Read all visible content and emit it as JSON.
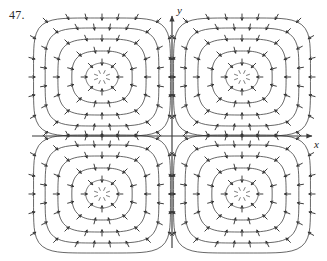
{
  "figure": {
    "exercise_number": "47.",
    "caption": "",
    "background_color": "#ffffff",
    "stroke_color": "#333333",
    "axis_color": "#3a3a3a"
  },
  "axes": {
    "x_label": "x",
    "y_label": "y",
    "origin_px": [
      172,
      136
    ],
    "x_axis_y_px": 136,
    "y_axis_x_px": 172,
    "x_axis_start_px": 32,
    "x_axis_end_px": 312,
    "y_axis_start_px": 248,
    "y_axis_end_px": 16,
    "x_arrowhead": true,
    "y_arrowhead": true,
    "ticks_shown": false,
    "tick_labels": []
  },
  "chart_data": {
    "type": "scatter",
    "title": "",
    "subtitle": "",
    "xlabel": "x",
    "ylabel": "y",
    "xlim": [
      -2.2,
      2.2
    ],
    "ylim": [
      -2.0,
      2.0
    ],
    "grid": false,
    "legend_position": "none",
    "plot_kind": "direction-field-with-contours",
    "annotations": [
      "47."
    ],
    "critical_points": [
      {
        "name": "sink-quadrant-2",
        "x": -1.1,
        "y": 1.0,
        "type": "sink",
        "px": [
          102,
          77
        ]
      },
      {
        "name": "sink-quadrant-1",
        "x": 1.1,
        "y": 1.0,
        "type": "sink",
        "px": [
          242,
          77
        ]
      },
      {
        "name": "sink-quadrant-3",
        "x": -1.1,
        "y": -1.0,
        "type": "sink",
        "px": [
          102,
          194
        ]
      },
      {
        "name": "sink-quadrant-4",
        "x": 1.1,
        "y": -1.0,
        "type": "sink",
        "px": [
          242,
          194
        ]
      }
    ],
    "contour_levels": [
      0.2,
      0.42,
      0.64,
      0.86,
      1.08
    ],
    "contour_radii_px": [
      14,
      26,
      38,
      49,
      59
    ],
    "arrow_rings_px": [
      18,
      30,
      42,
      53,
      63
    ],
    "arrow_direction": "inward",
    "arrows_per_ring": [
      8,
      12,
      16,
      20,
      24
    ],
    "field_bounds_px": {
      "left": 32,
      "right": 312,
      "top": 16,
      "bottom": 248
    },
    "grid_spacing_px": 11.5,
    "series": [
      {
        "name": "contours-quadrant-2",
        "center_px": [
          102,
          77
        ],
        "values": [
          14,
          26,
          38,
          49,
          59
        ]
      },
      {
        "name": "contours-quadrant-1",
        "center_px": [
          242,
          77
        ],
        "values": [
          14,
          26,
          38,
          49,
          59
        ]
      },
      {
        "name": "contours-quadrant-3",
        "center_px": [
          102,
          194
        ],
        "values": [
          14,
          26,
          38,
          49,
          59
        ]
      },
      {
        "name": "contours-quadrant-4",
        "center_px": [
          242,
          194
        ],
        "values": [
          14,
          26,
          38,
          49,
          59
        ]
      }
    ]
  }
}
